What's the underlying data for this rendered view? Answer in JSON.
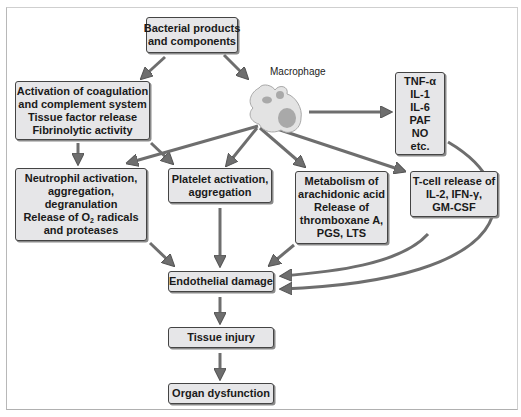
{
  "diagram": {
    "title_node": {
      "lines": [
        "Bacterial products",
        "and components"
      ]
    },
    "macrophage_label": "Macrophage",
    "coagulation": {
      "lines": [
        "Activation of coagulation",
        "and complement system",
        "Tissue factor release",
        "Fibrinolytic activity"
      ]
    },
    "cytokines": {
      "lines": [
        "TNF-α",
        "IL-1",
        "IL-6",
        "PAF",
        "NO",
        "etc."
      ]
    },
    "neutrophil": {
      "lines": [
        "Neutrophil activation,",
        "aggregation,",
        "degranulation"
      ],
      "o2_prefix": "Release of O",
      "o2_sub": "2",
      "o2_suffix": " radicals",
      "last": "and proteases"
    },
    "platelet": {
      "lines": [
        "Platelet activation,",
        "aggregation"
      ]
    },
    "arachidonic": {
      "lines": [
        "Metabolism of",
        "arachidonic acid",
        "Release of",
        "thromboxane A,",
        "PGS, LTS"
      ]
    },
    "tcell": {
      "lines": [
        "T-cell release of",
        "IL-2, IFN-γ,",
        "GM-CSF"
      ]
    },
    "endothelial": {
      "label": "Endothelial damage"
    },
    "tissue": {
      "label": "Tissue injury"
    },
    "organ": {
      "label": "Organ dysfunction"
    },
    "colors": {
      "box_fill": "#e6e6e8",
      "arrow": "#6e6e6e",
      "arrow_stroke": "#555555"
    }
  }
}
